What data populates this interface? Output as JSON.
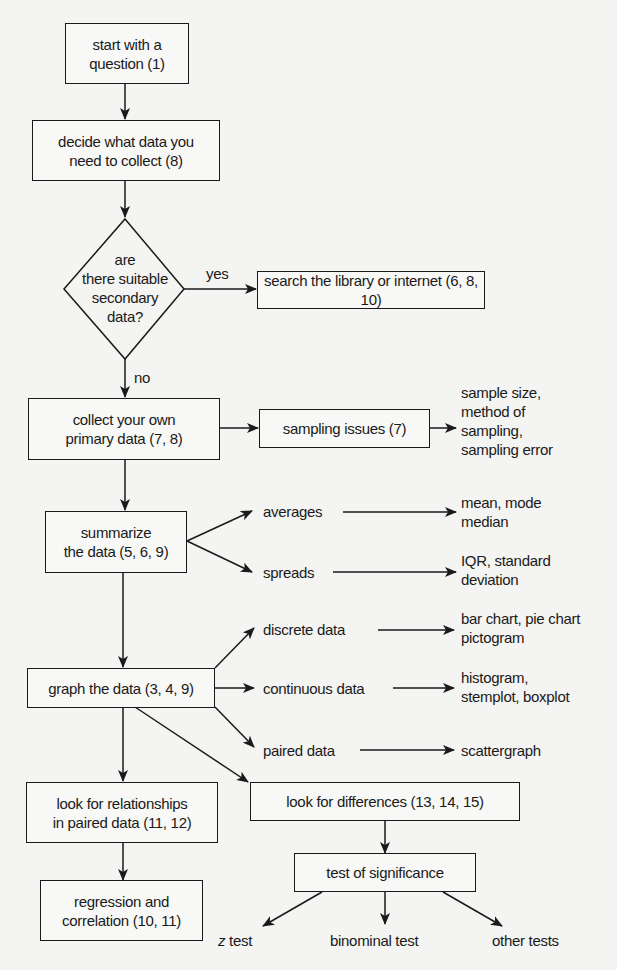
{
  "diagram": {
    "type": "flowchart",
    "nodes": {
      "start": "start with a question (1)",
      "decide": "decide what data you need to collect (8)",
      "decision": "are there suitable secondary data?",
      "search": "search the library or internet (6, 8, 10)",
      "collect": "collect your own primary data (7, 8)",
      "sampling": "sampling issues (7)",
      "sampling_detail": "sample size, method of sampling, sampling error",
      "summarize": "summarize the data (5, 6, 9)",
      "averages": "averages",
      "averages_detail": "mean, mode median",
      "spreads": "spreads",
      "spreads_detail": "IQR, standard deviation",
      "graph": "graph the data (3, 4, 9)",
      "discrete": "discrete data",
      "discrete_detail": "bar chart, pie chart pictogram",
      "continuous": "continuous data",
      "continuous_detail": "histogram, stemplot, boxplot",
      "paired": "paired data",
      "paired_detail": "scattergraph",
      "relationships": "look for relationships in paired data (11, 12)",
      "regression": "regression and correlation (10, 11)",
      "differences": "look for differences (13, 14, 15)",
      "significance": "test of significance",
      "ztest_var": "z",
      "ztest": " test",
      "binominal": "binominal test",
      "other": "other tests"
    },
    "lines": {
      "start_1": "start with a",
      "start_2": "question (1)",
      "decide_1": "decide what data you",
      "decide_2": "need to collect (8)",
      "decision_1": "are",
      "decision_2": "there suitable",
      "decision_3": "secondary",
      "decision_4": "data?",
      "collect_1": "collect your own",
      "collect_2": "primary data (7, 8)",
      "sampling_detail_1": "sample size,",
      "sampling_detail_2": "method of",
      "sampling_detail_3": "sampling,",
      "sampling_detail_4": "sampling error",
      "summarize_1": "summarize",
      "summarize_2": "the data (5, 6, 9)",
      "averages_detail_1": "mean, mode",
      "averages_detail_2": "median",
      "spreads_detail_1": "IQR, standard",
      "spreads_detail_2": "deviation",
      "discrete_detail_1": "bar chart, pie chart",
      "discrete_detail_2": "pictogram",
      "continuous_detail_1": "histogram,",
      "continuous_detail_2": "stemplot, boxplot",
      "relationships_1": "look for relationships",
      "relationships_2": "in paired data (11, 12)",
      "regression_1": "regression and",
      "regression_2": "correlation (10, 11)"
    },
    "edge_labels": {
      "yes": "yes",
      "no": "no"
    },
    "colors": {
      "background": "#f4f4f2",
      "stroke": "#1a1a1a"
    }
  }
}
